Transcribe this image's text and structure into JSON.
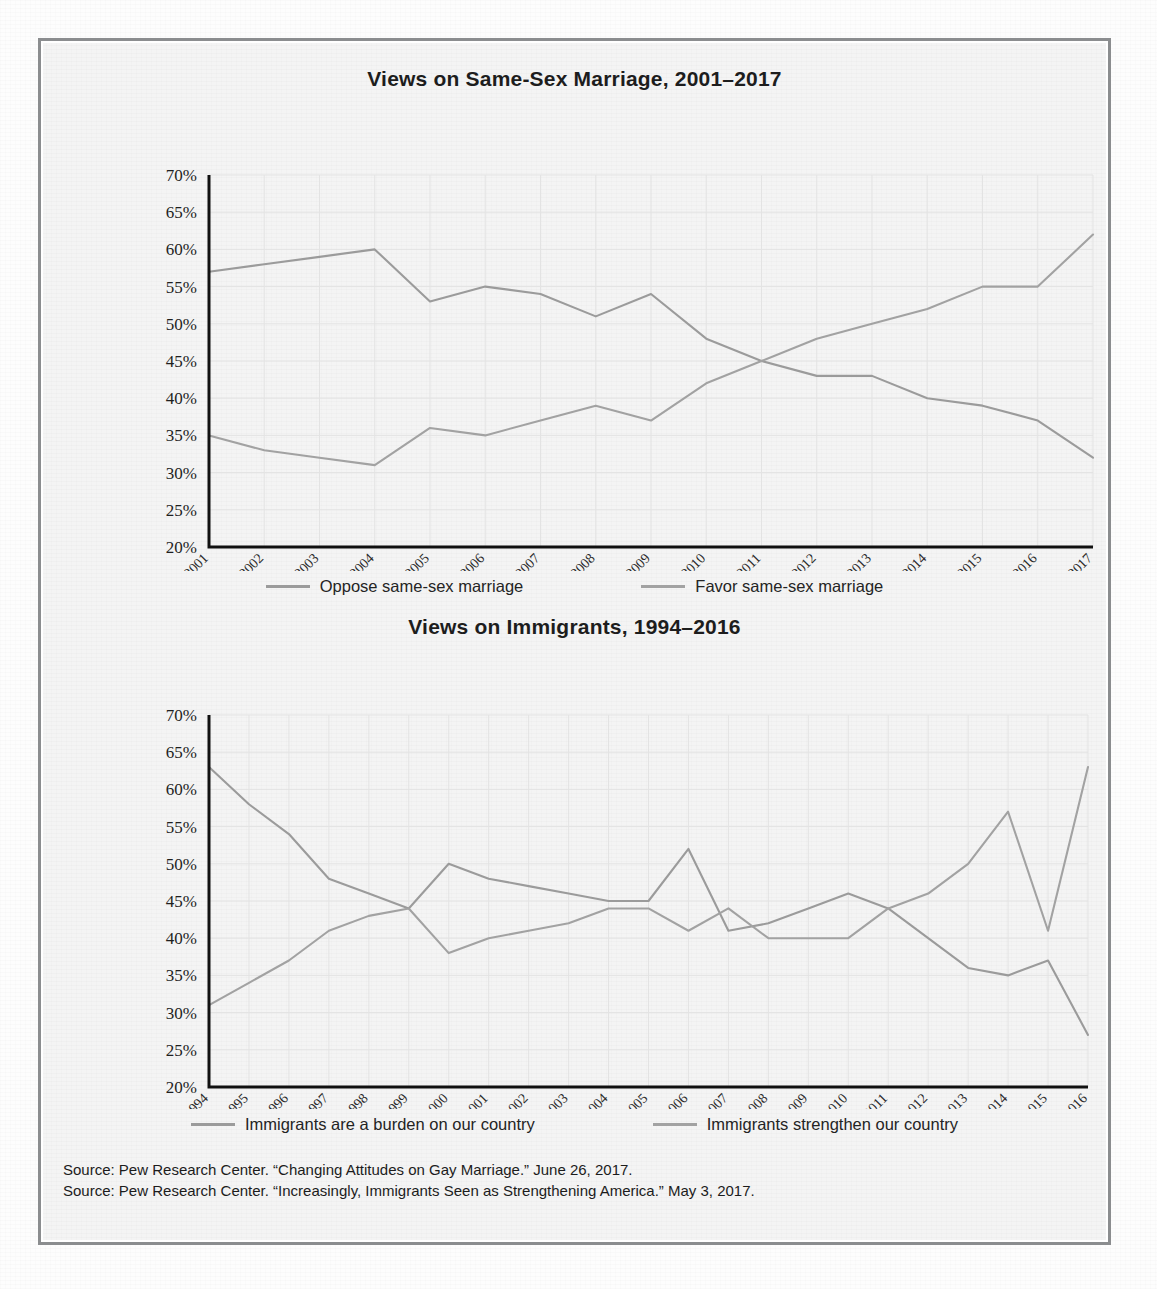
{
  "figure": {
    "frame_color": "#8b8d8f",
    "background_color": "#f4f4f4"
  },
  "sources": {
    "line1": "Source: Pew Research Center. “Changing Attitudes on Gay Marriage.” June 26, 2017.",
    "line2": "Source: Pew Research Center. “Increasingly, Immigrants Seen as Strengthening America.” May 3, 2017."
  },
  "chart_data": [
    {
      "id": "same-sex-marriage",
      "type": "line",
      "title": "Views on Same-Sex Marriage, 2001–2017",
      "xlabel": "",
      "ylabel": "",
      "ylim": [
        20,
        70
      ],
      "ytick_step": 5,
      "ytick_labels": [
        "70%",
        "65%",
        "60%",
        "55%",
        "50%",
        "45%",
        "40%",
        "35%",
        "30%",
        "25%",
        "20%"
      ],
      "ytick_values": [
        70,
        65,
        60,
        55,
        50,
        45,
        40,
        35,
        30,
        25,
        20
      ],
      "grid": true,
      "legend_position": "bottom",
      "categories": [
        "2001",
        "2002",
        "2003",
        "2004",
        "2005",
        "2006",
        "2007",
        "2008",
        "2009",
        "2010",
        "2011",
        "2012",
        "2013",
        "2014",
        "2015",
        "2016",
        "2017"
      ],
      "series": [
        {
          "name": "Oppose same-sex marriage",
          "color": "#9b9b9b",
          "values": [
            57,
            58,
            59,
            60,
            53,
            55,
            54,
            51,
            54,
            48,
            45,
            43,
            43,
            40,
            39,
            37,
            32
          ]
        },
        {
          "name": "Favor same-sex marriage",
          "color": "#a2a2a2",
          "values": [
            35,
            33,
            32,
            31,
            36,
            35,
            37,
            39,
            37,
            42,
            45,
            48,
            50,
            52,
            55,
            55,
            62
          ]
        }
      ]
    },
    {
      "id": "immigrants",
      "type": "line",
      "title": "Views on Immigrants, 1994–2016",
      "xlabel": "",
      "ylabel": "",
      "ylim": [
        20,
        70
      ],
      "ytick_step": 5,
      "ytick_labels": [
        "70%",
        "65%",
        "60%",
        "55%",
        "50%",
        "45%",
        "40%",
        "35%",
        "30%",
        "25%",
        "20%"
      ],
      "ytick_values": [
        70,
        65,
        60,
        55,
        50,
        45,
        40,
        35,
        30,
        25,
        20
      ],
      "grid": true,
      "legend_position": "bottom",
      "categories": [
        "1994",
        "1995",
        "1996",
        "1997",
        "1998",
        "1999",
        "2000",
        "2001",
        "2002",
        "2003",
        "2004",
        "2005",
        "2006",
        "2007",
        "2008",
        "2009",
        "2010",
        "2011",
        "2012",
        "2013",
        "2014",
        "2015",
        "2016"
      ],
      "series": [
        {
          "name": "Immigrants are a burden on our country",
          "color": "#9b9b9b",
          "values": [
            63,
            58,
            54,
            48,
            46,
            44,
            50,
            48,
            47,
            46,
            45,
            45,
            52,
            41,
            42,
            44,
            46,
            44,
            40,
            36,
            35,
            37,
            27
          ]
        },
        {
          "name": "Immigrants strengthen our country",
          "color": "#a2a2a2",
          "values": [
            31,
            34,
            37,
            41,
            43,
            44,
            38,
            40,
            41,
            42,
            44,
            44,
            41,
            44,
            40,
            40,
            40,
            44,
            46,
            50,
            57,
            41,
            63
          ]
        }
      ]
    }
  ]
}
